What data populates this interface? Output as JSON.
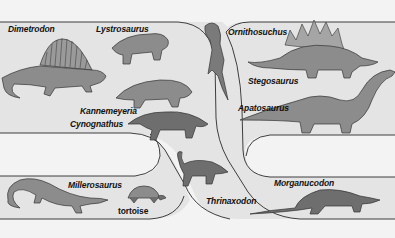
{
  "diagram": {
    "type": "phylogenetic-tree",
    "colors": {
      "background": "#f3f3f3",
      "lineage_fill": "#e4e4e4",
      "outline": "#2a2a2a",
      "animal_fill": "#8a8a8a",
      "animal_dark": "#3a3a3a"
    },
    "lineages": [
      {
        "id": "synapsid-early",
        "taxa": [
          "Dimetrodon",
          "Lystrosaurus",
          "Kannemeyeria",
          "Cynognathus"
        ]
      },
      {
        "id": "archosaur",
        "taxa": [
          "Ornithosuchus",
          "Stegosaurus",
          "Apatosaurus"
        ]
      },
      {
        "id": "lepidosaur-turtle",
        "taxa": [
          "Millerosaurus",
          "tortoise"
        ]
      },
      {
        "id": "mammal-line",
        "taxa": [
          "Thrinaxodon",
          "Morganucodon"
        ]
      }
    ],
    "labels": {
      "dimetrodon": "Dimetrodon",
      "lystrosaurus": "Lystrosaurus",
      "kannemeyeria": "Kannemeyeria",
      "cynognathus": "Cynognathus",
      "ornithosuchus": "Ornithosuchus",
      "stegosaurus": "Stegosaurus",
      "apatosaurus": "Apatosaurus",
      "millerosaurus": "Millerosaurus",
      "tortoise": "tortoise",
      "thrinaxodon": "Thrinaxodon",
      "morganucodon": "Morganucodon"
    }
  }
}
